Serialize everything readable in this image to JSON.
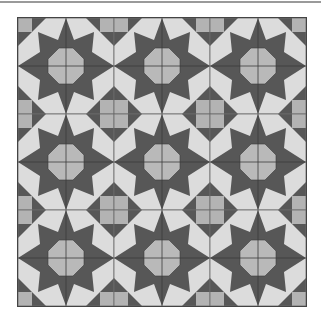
{
  "figure": {
    "grid": {
      "rows": 3,
      "cols": 3,
      "tile_size": 96
    },
    "colors": {
      "background": "#ffffff",
      "dark_star": "#575757",
      "light_shape": "#dcdcdc",
      "octagon": "#b9b9b9",
      "corner": "#b3b3b3",
      "line": "#3a3a3a",
      "top_rule": "#9a9a9a"
    }
  }
}
